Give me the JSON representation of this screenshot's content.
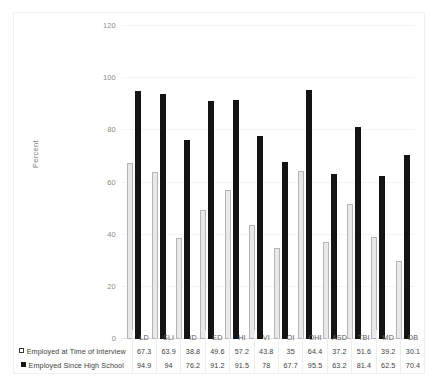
{
  "page": {
    "top_clipped_text": "                                                                                                                               "
  },
  "chart_data": {
    "type": "bar",
    "title": "",
    "xlabel": "",
    "ylabel": "Percent",
    "ylim": [
      0,
      120
    ],
    "yticks": [
      0,
      20,
      40,
      60,
      80,
      100,
      120
    ],
    "grid": true,
    "legend_position": "bottom-table",
    "categories": [
      "LD",
      "SLI",
      "ID",
      "ED",
      "HI",
      "VI",
      "OI",
      "OHI",
      "ASD",
      "TBI",
      "MD",
      "DB"
    ],
    "series": [
      {
        "name": "Employed at Time of Interview",
        "marker": "open-square",
        "color": "#e9e9e9",
        "values": [
          67.3,
          63.9,
          38.8,
          49.6,
          57.2,
          43.8,
          35,
          64.4,
          37.2,
          51.6,
          39.2,
          30.1
        ]
      },
      {
        "name": "Employed Since High School",
        "marker": "filled-square",
        "color": "#141414",
        "values": [
          94.9,
          94,
          76.2,
          91.2,
          91.5,
          78,
          67.7,
          95.5,
          63.2,
          81.4,
          62.5,
          70.4
        ]
      }
    ]
  }
}
